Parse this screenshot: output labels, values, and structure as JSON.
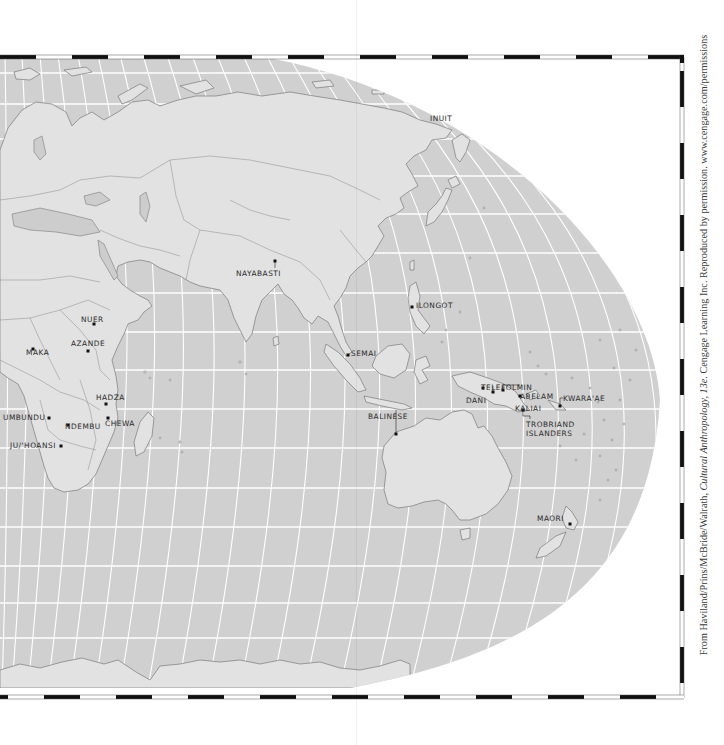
{
  "map": {
    "colors": {
      "ocean": "#d0d0d0",
      "land": "#e2e2e2",
      "land_shaded": "#cdcdcd",
      "graticule": "#ffffff",
      "coast": "#7a7a7a",
      "paper": "#ffffff",
      "border_black": "#111111"
    },
    "labels": [
      {
        "id": "inuit",
        "text": "INUIT",
        "x": 430,
        "y": 115
      },
      {
        "id": "nayabasti",
        "text": "NAYABASTI",
        "x": 236,
        "y": 270
      },
      {
        "id": "ilongot",
        "text": "ILONGOT",
        "x": 416,
        "y": 302
      },
      {
        "id": "nuer",
        "text": "NUER",
        "x": 81,
        "y": 316
      },
      {
        "id": "azande",
        "text": "AZANDE",
        "x": 71,
        "y": 340
      },
      {
        "id": "maka",
        "text": "MAKA",
        "x": 26,
        "y": 349
      },
      {
        "id": "semai",
        "text": "SEMAI",
        "x": 351,
        "y": 350
      },
      {
        "id": "telefolmin",
        "text": "TELEFOLMIN",
        "x": 481,
        "y": 384
      },
      {
        "id": "abelam",
        "text": "ABELAM",
        "x": 520,
        "y": 393
      },
      {
        "id": "hadza",
        "text": "HADZA",
        "x": 96,
        "y": 394
      },
      {
        "id": "dani",
        "text": "DANI",
        "x": 466,
        "y": 397
      },
      {
        "id": "kaliai",
        "text": "KALIAI",
        "x": 515,
        "y": 405
      },
      {
        "id": "kwaraae",
        "text": "KWARA'AE",
        "x": 563,
        "y": 395
      },
      {
        "id": "umbundu",
        "text": "UMBUNDU",
        "x": 3,
        "y": 414
      },
      {
        "id": "chewa",
        "text": "CHEWA",
        "x": 105,
        "y": 420
      },
      {
        "id": "ndembu",
        "text": "NDEMBU",
        "x": 65,
        "y": 423
      },
      {
        "id": "balinese",
        "text": "BALINESE",
        "x": 368,
        "y": 413
      },
      {
        "id": "trobriand",
        "text": "TROBRIAND",
        "x": 526,
        "y": 421
      },
      {
        "id": "trobriand2",
        "text": "ISLANDERS",
        "x": 526,
        "y": 430
      },
      {
        "id": "juhoansi",
        "text": "JU/'HOANSI",
        "x": 10,
        "y": 442
      },
      {
        "id": "maori",
        "text": "MAORI",
        "x": 537,
        "y": 515
      }
    ],
    "points": [
      {
        "id": "nayabasti",
        "x": 275,
        "y": 261
      },
      {
        "id": "ilongot",
        "x": 412,
        "y": 307
      },
      {
        "id": "nuer",
        "x": 94,
        "y": 324
      },
      {
        "id": "azande",
        "x": 88,
        "y": 351
      },
      {
        "id": "maka",
        "x": 33,
        "y": 349
      },
      {
        "id": "semai",
        "x": 348,
        "y": 355
      },
      {
        "id": "telefolmin",
        "x": 493,
        "y": 392
      },
      {
        "id": "abelam",
        "x": 503,
        "y": 390
      },
      {
        "id": "hadza",
        "x": 106,
        "y": 404
      },
      {
        "id": "dani",
        "x": 483,
        "y": 388
      },
      {
        "id": "kaliai",
        "x": 520,
        "y": 396
      },
      {
        "id": "kwaraae",
        "x": 560,
        "y": 406
      },
      {
        "id": "umbundu",
        "x": 49,
        "y": 418
      },
      {
        "id": "chewa",
        "x": 108,
        "y": 418
      },
      {
        "id": "ndembu",
        "x": 68,
        "y": 425
      },
      {
        "id": "balinese",
        "x": 396,
        "y": 434
      },
      {
        "id": "trobriand",
        "x": 523,
        "y": 410
      },
      {
        "id": "juhoansi",
        "x": 61,
        "y": 446
      },
      {
        "id": "maori",
        "x": 570,
        "y": 524
      }
    ]
  },
  "credit": {
    "prefix": "From Haviland/Prins/McBride/Walrath, ",
    "title": "Cultural Anthropology, 13e",
    "suffix": ". Cengage Learning Inc. Reproduced by permission. www.cengage.com/permissions"
  }
}
